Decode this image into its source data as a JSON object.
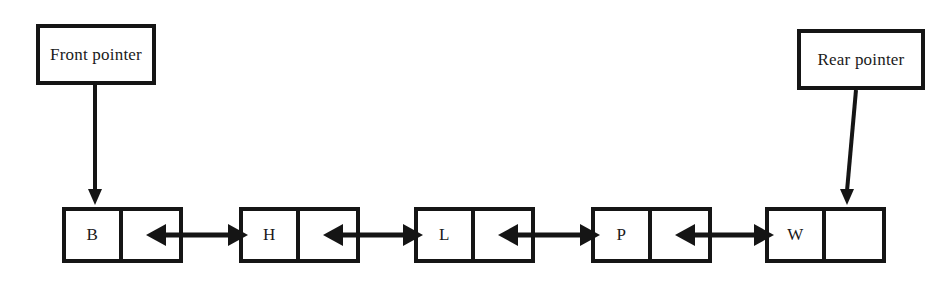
{
  "diagram": {
    "background_color": "#ffffff",
    "ink_color": "#151515",
    "pointers": [
      {
        "name": "front-pointer",
        "label": "Front pointer",
        "box": {
          "x": 36,
          "y": 24,
          "w": 120,
          "h": 61
        },
        "arrow": {
          "x1": 95,
          "y1": 85,
          "x2": 95,
          "y2": 205
        },
        "targets": "node-b"
      },
      {
        "name": "rear-pointer",
        "label": "Rear pointer",
        "box": {
          "x": 797,
          "y": 29,
          "w": 128,
          "h": 61
        },
        "arrow": {
          "x1": 856,
          "y1": 90,
          "x2": 847,
          "y2": 205
        },
        "targets": "node-w"
      }
    ],
    "nodes": [
      {
        "name": "node-b",
        "value": "B",
        "link": "",
        "x": 62,
        "y": 207,
        "w": 121,
        "h": 56
      },
      {
        "name": "node-h",
        "value": "H",
        "link": "",
        "x": 239,
        "y": 207,
        "w": 121,
        "h": 56
      },
      {
        "name": "node-l",
        "value": "L",
        "link": "",
        "x": 414,
        "y": 207,
        "w": 121,
        "h": 56
      },
      {
        "name": "node-p",
        "value": "P",
        "link": "",
        "x": 591,
        "y": 207,
        "w": 121,
        "h": 56
      },
      {
        "name": "node-w",
        "value": "W",
        "link": "",
        "x": 765,
        "y": 207,
        "w": 121,
        "h": 56
      }
    ],
    "links": [
      {
        "name": "link-b-h",
        "from": "node-b",
        "to": "node-h",
        "x1": 146,
        "x2": 248,
        "y": 235,
        "double_headed": true
      },
      {
        "name": "link-h-l",
        "from": "node-h",
        "to": "node-l",
        "x1": 323,
        "x2": 423,
        "y": 235,
        "double_headed": true
      },
      {
        "name": "link-l-p",
        "from": "node-l",
        "to": "node-p",
        "x1": 498,
        "x2": 600,
        "y": 235,
        "double_headed": true
      },
      {
        "name": "link-p-w",
        "from": "node-p",
        "to": "node-w",
        "x1": 675,
        "x2": 774,
        "y": 235,
        "double_headed": true
      }
    ]
  }
}
